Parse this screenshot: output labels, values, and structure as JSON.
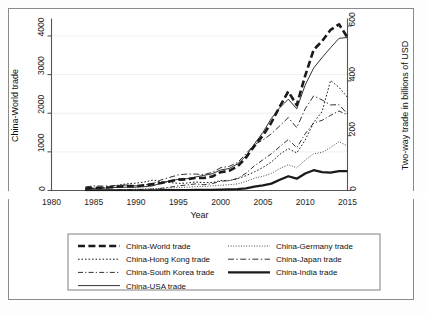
{
  "chart_data": {
    "type": "line",
    "title": "",
    "xlabel": "Year",
    "ylabel": "China-World trade",
    "y2label": "Two-way trade in billions of USD",
    "xlim": [
      1980,
      2015
    ],
    "ylim": [
      0,
      4400
    ],
    "y2lim": [
      0,
      620
    ],
    "xticks": [
      1980,
      1985,
      1990,
      1995,
      2000,
      2005,
      2010,
      2015
    ],
    "yticks": [
      0,
      1000,
      2000,
      3000,
      4000
    ],
    "y2ticks": [
      0,
      200,
      400,
      600
    ],
    "grid": "horizontal-light",
    "legend_position": "below-plot-two-columns",
    "x": [
      1984,
      1985,
      1986,
      1987,
      1988,
      1989,
      1990,
      1991,
      1992,
      1993,
      1994,
      1995,
      1996,
      1997,
      1998,
      1999,
      2000,
      2001,
      2002,
      2003,
      2004,
      2005,
      2006,
      2007,
      2008,
      2009,
      2010,
      2011,
      2012,
      2013,
      2014,
      2015
    ],
    "series": [
      {
        "name": "China-World trade",
        "axis": "left",
        "units": "billions of USD",
        "style": "thick-dashed",
        "values": [
          53,
          70,
          74,
          83,
          102,
          112,
          115,
          135,
          166,
          196,
          237,
          281,
          290,
          325,
          324,
          361,
          474,
          510,
          621,
          851,
          1155,
          1422,
          1760,
          2176,
          2563,
          2208,
          2974,
          3642,
          3867,
          4159,
          4301,
          3960
        ]
      },
      {
        "name": "China-Hong Kong trade",
        "axis": "right",
        "units": "billions of USD",
        "style": "dotted",
        "values": [
          6,
          8,
          10,
          14,
          20,
          25,
          27,
          31,
          38,
          32,
          29,
          26,
          27,
          31,
          29,
          29,
          36,
          36,
          43,
          54,
          68,
          84,
          104,
          132,
          153,
          137,
          184,
          248,
          288,
          401,
          376,
          340
        ]
      },
      {
        "name": "China-South Korea trade",
        "axis": "right",
        "units": "billions of USD",
        "style": "dash-dot",
        "values": [
          0,
          0,
          1,
          1,
          2,
          3,
          3,
          4,
          5,
          8,
          12,
          17,
          20,
          24,
          21,
          25,
          34,
          36,
          44,
          63,
          90,
          112,
          134,
          160,
          186,
          156,
          207,
          246,
          256,
          274,
          290,
          275
        ]
      },
      {
        "name": "China-USA trade",
        "axis": "right",
        "units": "billions of USD",
        "style": "thin-solid",
        "values": [
          6,
          8,
          8,
          10,
          12,
          12,
          12,
          14,
          17,
          28,
          35,
          41,
          43,
          49,
          55,
          61,
          75,
          80,
          97,
          126,
          170,
          212,
          263,
          302,
          333,
          298,
          385,
          447,
          485,
          521,
          555,
          558
        ]
      },
      {
        "name": "China-Germany trade",
        "axis": "right",
        "units": "billions of USD",
        "style": "fine-dotted",
        "values": [
          2,
          2,
          3,
          3,
          4,
          4,
          5,
          6,
          7,
          8,
          9,
          11,
          12,
          14,
          15,
          17,
          19,
          21,
          24,
          33,
          45,
          52,
          62,
          80,
          94,
          83,
          111,
          134,
          139,
          157,
          178,
          162
        ]
      },
      {
        "name": "China-Japan trade",
        "axis": "right",
        "units": "billions of USD",
        "style": "dash-long-dot",
        "values": [
          13,
          17,
          16,
          17,
          19,
          20,
          17,
          20,
          25,
          39,
          48,
          57,
          60,
          60,
          58,
          66,
          83,
          88,
          102,
          134,
          168,
          184,
          207,
          236,
          266,
          229,
          298,
          345,
          330,
          312,
          313,
          279
        ]
      },
      {
        "name": "China-India trade",
        "axis": "right",
        "units": "billions of USD",
        "style": "thick-solid",
        "values": [
          0,
          0,
          0,
          0,
          0,
          0,
          0,
          0,
          0,
          1,
          1,
          1,
          1,
          2,
          2,
          2,
          3,
          4,
          5,
          8,
          14,
          19,
          25,
          39,
          52,
          43,
          62,
          74,
          67,
          65,
          71,
          71
        ]
      }
    ]
  },
  "axes": {
    "left_title": "China-World trade",
    "right_title": "Two-way trade in billions of USD",
    "x_title": "Year",
    "xtick_labels": [
      "1980",
      "1985",
      "1990",
      "1995",
      "2000",
      "2005",
      "2010",
      "2015"
    ],
    "ytick_labels": [
      "0",
      "1000",
      "2000",
      "3000",
      "4000"
    ],
    "y2tick_labels": [
      "0",
      "200",
      "400",
      "600"
    ]
  },
  "legend": {
    "column_left": [
      {
        "label": "China-World trade",
        "style": "thick-dashed"
      },
      {
        "label": "China-Hong Kong trade",
        "style": "dotted"
      },
      {
        "label": "China-South Korea trade",
        "style": "dash-dot"
      },
      {
        "label": "China-USA trade",
        "style": "thin-solid"
      }
    ],
    "column_right": [
      {
        "label": "China-Germany trade",
        "style": "fine-dotted"
      },
      {
        "label": "China-Japan trade",
        "style": "dash-long-dot"
      },
      {
        "label": "China-India trade",
        "style": "thick-solid"
      }
    ]
  },
  "colors": {
    "line": "#1a1a1a",
    "axis": "#555555",
    "grid": "#ededed",
    "border": "#8a8a8a",
    "background": "#ffffff"
  }
}
